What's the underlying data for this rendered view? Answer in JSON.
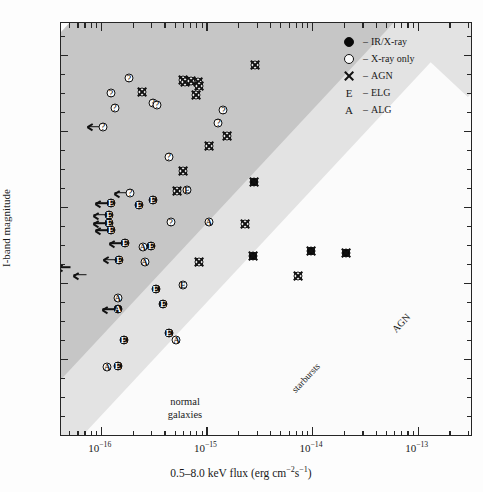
{
  "figure": {
    "domain": "chart",
    "background": "#fdfdfd"
  },
  "axes": {
    "ylabel": "I-band magnitude",
    "xlabel_parts": {
      "pre": "0.5–8.0 keV flux (erg cm",
      "sup1": "−2",
      "mid": "s",
      "sup2": "−1",
      "post": ")"
    },
    "y_ticklabels": [
      "26",
      "24",
      "22",
      "20",
      "18",
      "16"
    ],
    "x_ticklabels": [
      "10",
      "10",
      "10",
      "10"
    ],
    "x_tick_exponents": [
      "−16",
      "−15",
      "−14",
      "−13"
    ],
    "xscale": "log",
    "yscale": "linear",
    "xlim": [
      4.2e-17,
      3.2e-13
    ],
    "ylim": [
      16,
      26.85
    ],
    "y_major_ticks": [
      16,
      18,
      20,
      22,
      24,
      26
    ],
    "y_minor_step": 0.5,
    "grid": false
  },
  "legend": {
    "position": "top-right",
    "dash": "–",
    "items": [
      {
        "symbol": "filled-circle",
        "label": "IR/X-ray"
      },
      {
        "symbol": "open-circle",
        "label": "X-ray only"
      },
      {
        "symbol": "cross",
        "label": "AGN"
      },
      {
        "symbol": "letter-E",
        "label": "ELG"
      },
      {
        "symbol": "letter-A",
        "label": "ALG"
      }
    ]
  },
  "bands": [
    {
      "name": "normal galaxies",
      "color": "#fbfbfb",
      "label": "normal\ngalaxies",
      "label_line1": "normal",
      "label_line2": "galaxies"
    },
    {
      "name": "starbursts",
      "color": "#e3e3e3",
      "label": "starbursts"
    },
    {
      "name": "AGN",
      "color": "#c6c6c6",
      "label": "AGN"
    }
  ],
  "chart_data": {
    "type": "scatter",
    "title": "",
    "xlabel": "0.5–8.0 keV flux (erg cm^-2 s^-1)",
    "ylabel": "I-band magnitude",
    "xscale": "log",
    "xlim": [
      4.2e-17,
      3.2e-13
    ],
    "ylim": [
      16,
      26.85
    ],
    "marker_legend": {
      "filled-circle": "IR/X-ray",
      "open-circle": "X-ray only",
      "cross": "AGN",
      "E": "ELG",
      "A": "ALG",
      "?": "unidentified",
      "arrow": "upper limit"
    },
    "regions": [
      {
        "label": "normal galaxies",
        "shade": "white"
      },
      {
        "label": "starbursts",
        "shade": "light-gray"
      },
      {
        "label": "AGN",
        "shade": "dark-gray"
      }
    ],
    "points": [
      {
        "x": 2.9e-15,
        "y": 25.75,
        "fill": "open",
        "glyph": "X",
        "limit": false
      },
      {
        "x": 6e-16,
        "y": 25.35,
        "fill": "open",
        "glyph": "X",
        "limit": false
      },
      {
        "x": 6.3e-16,
        "y": 25.3,
        "fill": "open",
        "glyph": "X",
        "limit": false
      },
      {
        "x": 7.2e-16,
        "y": 25.32,
        "fill": "open",
        "glyph": "X",
        "limit": false
      },
      {
        "x": 8.3e-16,
        "y": 25.3,
        "fill": "open",
        "glyph": "X",
        "limit": false
      },
      {
        "x": 8.6e-16,
        "y": 25.18,
        "fill": "open",
        "glyph": "X",
        "limit": false
      },
      {
        "x": 8e-16,
        "y": 24.95,
        "fill": "open",
        "glyph": "X",
        "limit": false
      },
      {
        "x": 1.85e-16,
        "y": 25.4,
        "fill": "open",
        "glyph": "?",
        "limit": false
      },
      {
        "x": 1.25e-16,
        "y": 25.0,
        "fill": "open",
        "glyph": "?",
        "limit": false
      },
      {
        "x": 1.35e-16,
        "y": 24.62,
        "fill": "open",
        "glyph": "?",
        "limit": false
      },
      {
        "x": 2.45e-16,
        "y": 25.03,
        "fill": "open",
        "glyph": "X",
        "limit": false
      },
      {
        "x": 3.1e-16,
        "y": 24.75,
        "fill": "open",
        "glyph": "?",
        "limit": false
      },
      {
        "x": 3.4e-16,
        "y": 24.7,
        "fill": "open",
        "glyph": "?",
        "limit": false
      },
      {
        "x": 1.05e-16,
        "y": 24.12,
        "fill": "open",
        "glyph": "?",
        "limit": true
      },
      {
        "x": 1.45e-15,
        "y": 24.55,
        "fill": "open",
        "glyph": "?",
        "limit": false
      },
      {
        "x": 1.3e-15,
        "y": 24.22,
        "fill": "open",
        "glyph": "?",
        "limit": false
      },
      {
        "x": 1.55e-15,
        "y": 23.88,
        "fill": "open",
        "glyph": "X",
        "limit": false
      },
      {
        "x": 1.05e-15,
        "y": 23.62,
        "fill": "open",
        "glyph": "X",
        "limit": false
      },
      {
        "x": 4.4e-16,
        "y": 23.33,
        "fill": "open",
        "glyph": "?",
        "limit": false
      },
      {
        "x": 6e-16,
        "y": 22.95,
        "fill": "open",
        "glyph": "X",
        "limit": false
      },
      {
        "x": 2.8e-15,
        "y": 22.65,
        "fill": "filled",
        "glyph": "X",
        "limit": false
      },
      {
        "x": 5.3e-16,
        "y": 22.42,
        "fill": "open",
        "glyph": "X",
        "limit": false
      },
      {
        "x": 6.6e-16,
        "y": 22.45,
        "fill": "open",
        "glyph": "E",
        "limit": false
      },
      {
        "x": 1.9e-16,
        "y": 22.38,
        "fill": "open",
        "glyph": "?",
        "limit": true
      },
      {
        "x": 3.1e-16,
        "y": 22.2,
        "fill": "filled",
        "glyph": "E",
        "limit": false
      },
      {
        "x": 2.3e-16,
        "y": 22.05,
        "fill": "filled",
        "glyph": "E",
        "limit": false
      },
      {
        "x": 1.25e-16,
        "y": 22.1,
        "fill": "filled",
        "glyph": "E",
        "limit": true
      },
      {
        "x": 1.2e-16,
        "y": 21.8,
        "fill": "filled",
        "glyph": "E",
        "limit": true
      },
      {
        "x": 1.2e-16,
        "y": 21.58,
        "fill": "filled",
        "glyph": "E",
        "limit": true
      },
      {
        "x": 1.25e-16,
        "y": 21.4,
        "fill": "filled",
        "glyph": "E",
        "limit": true
      },
      {
        "x": 4.6e-16,
        "y": 21.6,
        "fill": "open",
        "glyph": "?",
        "limit": false
      },
      {
        "x": 1.05e-15,
        "y": 21.62,
        "fill": "open",
        "glyph": "A",
        "limit": false
      },
      {
        "x": 2.3e-15,
        "y": 21.55,
        "fill": "open",
        "glyph": "X",
        "limit": false
      },
      {
        "x": 1.7e-16,
        "y": 21.05,
        "fill": "filled",
        "glyph": "E",
        "limit": true
      },
      {
        "x": 2.5e-16,
        "y": 20.95,
        "fill": "open",
        "glyph": "A",
        "limit": false
      },
      {
        "x": 3e-16,
        "y": 20.98,
        "fill": "filled",
        "glyph": "E",
        "limit": false
      },
      {
        "x": 2.75e-15,
        "y": 20.72,
        "fill": "filled",
        "glyph": "X",
        "limit": false
      },
      {
        "x": 9.8e-15,
        "y": 20.85,
        "fill": "filled",
        "glyph": "X",
        "limit": false
      },
      {
        "x": 2.1e-14,
        "y": 20.78,
        "fill": "filled",
        "glyph": "X",
        "limit": false
      },
      {
        "x": 1.5e-16,
        "y": 20.62,
        "fill": "filled",
        "glyph": "E",
        "limit": true
      },
      {
        "x": 2.6e-16,
        "y": 20.55,
        "fill": "open",
        "glyph": "A",
        "limit": false
      },
      {
        "x": 8.5e-16,
        "y": 20.55,
        "fill": "open",
        "glyph": "X",
        "limit": false
      },
      {
        "x": 5.4e-17,
        "y": 20.42,
        "fill": "none",
        "glyph": "",
        "limit": true
      },
      {
        "x": 7.8e-17,
        "y": 20.22,
        "fill": "none",
        "glyph": "",
        "limit": true
      },
      {
        "x": 7.3e-15,
        "y": 20.18,
        "fill": "open",
        "glyph": "X",
        "limit": false
      },
      {
        "x": 6e-16,
        "y": 19.95,
        "fill": "open",
        "glyph": "E",
        "limit": false
      },
      {
        "x": 3.3e-16,
        "y": 19.85,
        "fill": "filled",
        "glyph": "E",
        "limit": false
      },
      {
        "x": 1.45e-16,
        "y": 19.62,
        "fill": "open",
        "glyph": "A",
        "limit": false
      },
      {
        "x": 1.45e-16,
        "y": 19.32,
        "fill": "filled",
        "glyph": "A",
        "limit": true
      },
      {
        "x": 3.9e-16,
        "y": 19.45,
        "fill": "filled",
        "glyph": "E",
        "limit": false
      },
      {
        "x": 4.4e-16,
        "y": 18.68,
        "fill": "filled",
        "glyph": "E",
        "limit": false
      },
      {
        "x": 5.2e-16,
        "y": 18.5,
        "fill": "open",
        "glyph": "A",
        "limit": false
      },
      {
        "x": 1.65e-16,
        "y": 18.5,
        "fill": "filled",
        "glyph": "E",
        "limit": false
      },
      {
        "x": 1.15e-16,
        "y": 17.8,
        "fill": "open",
        "glyph": "A",
        "limit": false
      },
      {
        "x": 1.45e-16,
        "y": 17.82,
        "fill": "filled",
        "glyph": "E",
        "limit": false
      }
    ]
  }
}
